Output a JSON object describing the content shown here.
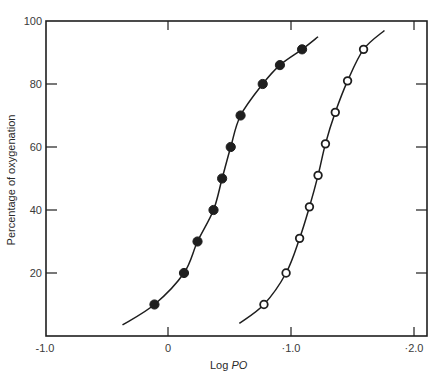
{
  "chart_data": {
    "type": "scatter",
    "title": "",
    "xlabel": "Log PO",
    "xlabel_main": "Log ",
    "xlabel_italic": "PO",
    "ylabel": "Percentage of oxygenation",
    "xlim": [
      -1.0,
      2.0
    ],
    "ylim": [
      0,
      100
    ],
    "x_ticks": [
      {
        "value": -1.0,
        "label": "-1.0"
      },
      {
        "value": 0,
        "label": "0"
      },
      {
        "value": 1.0,
        "label": "·1.0"
      },
      {
        "value": 2.0,
        "label": "·2.0"
      }
    ],
    "y_ticks": [
      {
        "value": 20,
        "label": "20"
      },
      {
        "value": 40,
        "label": "40"
      },
      {
        "value": 60,
        "label": "60"
      },
      {
        "value": 80,
        "label": "80"
      },
      {
        "value": 100,
        "label": "100"
      }
    ],
    "grid": false,
    "series": [
      {
        "name": "filled circles",
        "marker": "filled-circle",
        "points": [
          {
            "x": -0.11,
            "y": 10
          },
          {
            "x": 0.13,
            "y": 20
          },
          {
            "x": 0.24,
            "y": 30
          },
          {
            "x": 0.37,
            "y": 40
          },
          {
            "x": 0.44,
            "y": 50
          },
          {
            "x": 0.51,
            "y": 60
          },
          {
            "x": 0.59,
            "y": 70
          },
          {
            "x": 0.77,
            "y": 80
          },
          {
            "x": 0.91,
            "y": 86
          },
          {
            "x": 1.09,
            "y": 91
          }
        ],
        "curve": [
          {
            "x": -0.37,
            "y": 3.5
          },
          {
            "x": -0.11,
            "y": 10
          },
          {
            "x": 0.13,
            "y": 20
          },
          {
            "x": 0.24,
            "y": 30
          },
          {
            "x": 0.37,
            "y": 40
          },
          {
            "x": 0.44,
            "y": 50
          },
          {
            "x": 0.51,
            "y": 60
          },
          {
            "x": 0.59,
            "y": 70
          },
          {
            "x": 0.77,
            "y": 80
          },
          {
            "x": 0.91,
            "y": 86
          },
          {
            "x": 1.09,
            "y": 91
          },
          {
            "x": 1.22,
            "y": 95
          }
        ]
      },
      {
        "name": "open circles",
        "marker": "open-circle",
        "points": [
          {
            "x": 0.78,
            "y": 10
          },
          {
            "x": 0.96,
            "y": 20
          },
          {
            "x": 1.07,
            "y": 31
          },
          {
            "x": 1.15,
            "y": 41
          },
          {
            "x": 1.22,
            "y": 51
          },
          {
            "x": 1.28,
            "y": 61
          },
          {
            "x": 1.36,
            "y": 71
          },
          {
            "x": 1.46,
            "y": 81
          },
          {
            "x": 1.59,
            "y": 91
          }
        ],
        "curve": [
          {
            "x": 0.58,
            "y": 4
          },
          {
            "x": 0.78,
            "y": 10
          },
          {
            "x": 0.96,
            "y": 20
          },
          {
            "x": 1.07,
            "y": 31
          },
          {
            "x": 1.15,
            "y": 41
          },
          {
            "x": 1.22,
            "y": 51
          },
          {
            "x": 1.28,
            "y": 61
          },
          {
            "x": 1.36,
            "y": 71
          },
          {
            "x": 1.46,
            "y": 81
          },
          {
            "x": 1.59,
            "y": 91
          },
          {
            "x": 1.76,
            "y": 97
          }
        ]
      }
    ]
  },
  "layout": {
    "plot_left": 46,
    "plot_right": 427,
    "plot_top": 21,
    "plot_bottom": 336,
    "x0_px": 168,
    "px_per_x": 123,
    "ink": "#1e1e1e"
  }
}
